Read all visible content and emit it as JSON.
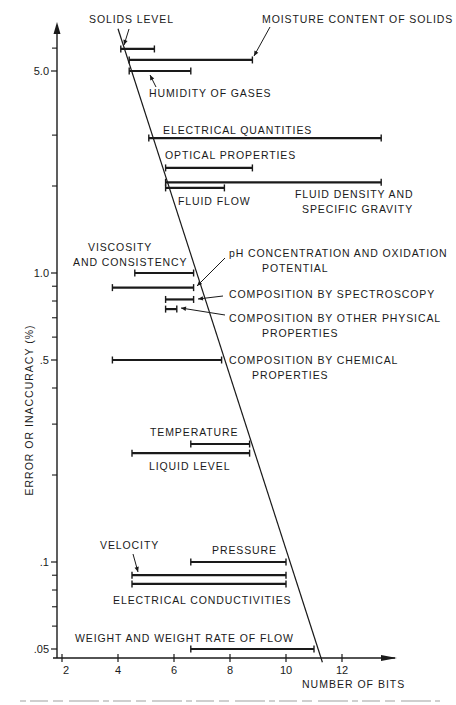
{
  "chart_data": {
    "type": "range-bar",
    "title": "",
    "xlabel": "NUMBER OF BITS",
    "ylabel": "ERROR OR INACCURACY (%)",
    "xscale": "linear",
    "yscale": "log",
    "xlim": [
      2,
      13.8
    ],
    "ylim": [
      0.045,
      7.5
    ],
    "x_ticks": [
      2,
      4,
      6,
      8,
      10,
      12
    ],
    "x_tick_labels": [
      "2",
      "4",
      "6",
      "8",
      "10",
      "12"
    ],
    "y_ticks_labeled": [
      5.0,
      1.0,
      0.5,
      0.1,
      0.05
    ],
    "y_tick_labels": [
      "5.0",
      "1.0",
      ".5",
      ".1",
      ".05"
    ],
    "y_ticks_minor": [
      6.0,
      3.0,
      2.0,
      0.9,
      0.8,
      0.7,
      0.6,
      0.4,
      0.3,
      0.2,
      0.09,
      0.08,
      0.07,
      0.06
    ],
    "grid": false,
    "legend": "none",
    "limit_line": {
      "description": "diagonal boundary",
      "points": [
        [
          4.0,
          7.0
        ],
        [
          11.3,
          0.045
        ]
      ]
    },
    "series": [
      {
        "name": "SOLIDS LEVEL",
        "error_pct": 5.96,
        "bits_min": 4.1,
        "bits_max": 5.3
      },
      {
        "name": "MOISTURE CONTENT OF SOLIDS",
        "error_pct": 5.46,
        "bits_min": 4.4,
        "bits_max": 8.8
      },
      {
        "name": "HUMIDITY OF GASES",
        "error_pct": 5.0,
        "bits_min": 4.4,
        "bits_max": 6.6
      },
      {
        "name": "ELECTRICAL QUANTITIES",
        "error_pct": 2.93,
        "bits_min": 5.1,
        "bits_max": 13.4
      },
      {
        "name": "OPTICAL PROPERTIES",
        "error_pct": 2.31,
        "bits_min": 5.7,
        "bits_max": 8.8
      },
      {
        "name": "FLUID DENSITY AND SPECIFIC GRAVITY",
        "error_pct": 2.06,
        "bits_min": 5.7,
        "bits_max": 13.4
      },
      {
        "name": "FLUID FLOW",
        "error_pct": 1.97,
        "bits_min": 5.7,
        "bits_max": 7.8
      },
      {
        "name": "VISCOSITY AND CONSISTENCY",
        "error_pct": 1.0,
        "bits_min": 4.6,
        "bits_max": 6.7
      },
      {
        "name": "pH CONCENTRATION AND OXIDATION POTENTIAL",
        "error_pct": 0.89,
        "bits_min": 3.8,
        "bits_max": 6.7
      },
      {
        "name": "COMPOSITION BY SPECTROSCOPY",
        "error_pct": 0.81,
        "bits_min": 5.7,
        "bits_max": 6.7
      },
      {
        "name": "COMPOSITION BY OTHER PHYSICAL PROPERTIES",
        "error_pct": 0.75,
        "bits_min": 5.7,
        "bits_max": 6.1
      },
      {
        "name": "COMPOSITION BY CHEMICAL PROPERTIES",
        "error_pct": 0.5,
        "bits_min": 3.8,
        "bits_max": 7.7
      },
      {
        "name": "TEMPERATURE",
        "error_pct": 0.256,
        "bits_min": 6.6,
        "bits_max": 8.7
      },
      {
        "name": "LIQUID LEVEL",
        "error_pct": 0.238,
        "bits_min": 4.5,
        "bits_max": 8.7
      },
      {
        "name": "PRESSURE",
        "error_pct": 0.1,
        "bits_min": 6.6,
        "bits_max": 10.0
      },
      {
        "name": "VELOCITY",
        "error_pct": 0.09,
        "bits_min": 4.5,
        "bits_max": 10.0
      },
      {
        "name": "ELECTRICAL CONDUCTIVITIES",
        "error_pct": 0.084,
        "bits_min": 4.5,
        "bits_max": 10.0
      },
      {
        "name": "WEIGHT AND WEIGHT RATE OF FLOW",
        "error_pct": 0.05,
        "bits_min": 6.6,
        "bits_max": 11.0
      }
    ],
    "annotations": [
      {
        "text": [
          "SOLIDS LEVEL"
        ]
      },
      {
        "text": [
          "MOISTURE CONTENT OF SOLIDS"
        ]
      },
      {
        "text": [
          "HUMIDITY OF GASES"
        ]
      },
      {
        "text": [
          "ELECTRICAL QUANTITIES"
        ]
      },
      {
        "text": [
          "OPTICAL PROPERTIES"
        ]
      },
      {
        "text": [
          "FLUID DENSITY AND",
          "SPECIFIC GRAVITY"
        ]
      },
      {
        "text": [
          "FLUID FLOW"
        ]
      },
      {
        "text": [
          "VISCOSITY",
          "AND CONSISTENCY"
        ]
      },
      {
        "text": [
          "pH CONCENTRATION AND OXIDATION",
          "POTENTIAL"
        ]
      },
      {
        "text": [
          "COMPOSITION BY SPECTROSCOPY"
        ]
      },
      {
        "text": [
          "COMPOSITION BY OTHER PHYSICAL",
          "PROPERTIES"
        ]
      },
      {
        "text": [
          "COMPOSITION BY CHEMICAL",
          "PROPERTIES"
        ]
      },
      {
        "text": [
          "TEMPERATURE"
        ]
      },
      {
        "text": [
          "LIQUID LEVEL"
        ]
      },
      {
        "text": [
          "PRESSURE"
        ]
      },
      {
        "text": [
          "VELOCITY"
        ]
      },
      {
        "text": [
          "ELECTRICAL CONDUCTIVITIES"
        ]
      },
      {
        "text": [
          "WEIGHT AND WEIGHT RATE OF FLOW"
        ]
      }
    ]
  },
  "colors": {
    "ink": "#1a1a1a",
    "background": "#ffffff",
    "caption": "#9a9a9a"
  }
}
